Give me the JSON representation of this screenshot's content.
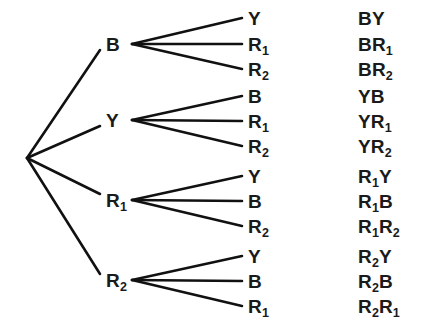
{
  "diagram": {
    "type": "probability-tree",
    "colors": {
      "background": "#ffffff",
      "line": "#111111",
      "text": "#1a1a1a"
    },
    "root": {
      "x": 27,
      "y": 158
    },
    "branch_fan_x": 132,
    "leaf_line_end_x": 242,
    "leaf_label_x": 248,
    "outcome_label_x": 358,
    "level1": [
      {
        "label": "B",
        "sub": "",
        "x": 106,
        "y": 44,
        "name": "node-b"
      },
      {
        "label": "Y",
        "sub": "",
        "x": 106,
        "y": 120,
        "name": "node-y"
      },
      {
        "label": "R",
        "sub": "1",
        "x": 106,
        "y": 200,
        "name": "node-r1"
      },
      {
        "label": "R",
        "sub": "2",
        "x": 106,
        "y": 280,
        "name": "node-r2"
      }
    ],
    "groups": [
      {
        "parent": "B",
        "leaves": [
          {
            "label": "Y",
            "sub": "",
            "y": 18,
            "outcome_first": "B",
            "outcome_first_sub": "",
            "outcome_second": "Y",
            "outcome_second_sub": ""
          },
          {
            "label": "R",
            "sub": "1",
            "y": 44,
            "outcome_first": "B",
            "outcome_first_sub": "",
            "outcome_second": "R",
            "outcome_second_sub": "1"
          },
          {
            "label": "R",
            "sub": "2",
            "y": 69,
            "outcome_first": "B",
            "outcome_first_sub": "",
            "outcome_second": "R",
            "outcome_second_sub": "2"
          }
        ]
      },
      {
        "parent": "Y",
        "leaves": [
          {
            "label": "B",
            "sub": "",
            "y": 96,
            "outcome_first": "Y",
            "outcome_first_sub": "",
            "outcome_second": "B",
            "outcome_second_sub": ""
          },
          {
            "label": "R",
            "sub": "1",
            "y": 121,
            "outcome_first": "Y",
            "outcome_first_sub": "",
            "outcome_second": "R",
            "outcome_second_sub": "1"
          },
          {
            "label": "R",
            "sub": "2",
            "y": 146,
            "outcome_first": "Y",
            "outcome_first_sub": "",
            "outcome_second": "R",
            "outcome_second_sub": "2"
          }
        ]
      },
      {
        "parent": "R1",
        "leaves": [
          {
            "label": "Y",
            "sub": "",
            "y": 176,
            "outcome_first": "R",
            "outcome_first_sub": "1",
            "outcome_second": "Y",
            "outcome_second_sub": ""
          },
          {
            "label": "B",
            "sub": "",
            "y": 201,
            "outcome_first": "R",
            "outcome_first_sub": "1",
            "outcome_second": "B",
            "outcome_second_sub": ""
          },
          {
            "label": "R",
            "sub": "2",
            "y": 226,
            "outcome_first": "R",
            "outcome_first_sub": "1",
            "outcome_second": "R",
            "outcome_second_sub": "2"
          }
        ]
      },
      {
        "parent": "R2",
        "leaves": [
          {
            "label": "Y",
            "sub": "",
            "y": 256,
            "outcome_first": "R",
            "outcome_first_sub": "2",
            "outcome_second": "Y",
            "outcome_second_sub": ""
          },
          {
            "label": "B",
            "sub": "",
            "y": 281,
            "outcome_first": "R",
            "outcome_first_sub": "2",
            "outcome_second": "B",
            "outcome_second_sub": ""
          },
          {
            "label": "R",
            "sub": "1",
            "y": 306,
            "outcome_first": "R",
            "outcome_first_sub": "2",
            "outcome_second": "R",
            "outcome_second_sub": "1"
          }
        ]
      }
    ]
  }
}
